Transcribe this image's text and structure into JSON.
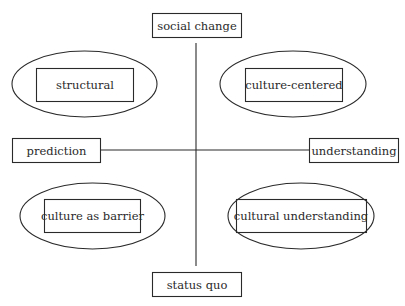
{
  "axes": {
    "vertical": {
      "top": "social change",
      "bottom": "status quo"
    },
    "horizontal": {
      "left": "prediction",
      "right": "understanding"
    }
  },
  "quadrants": {
    "top_left": "structural",
    "top_right": "culture-centered",
    "bottom_left": "culture as barrier",
    "bottom_right": "cultural understanding"
  },
  "colors": {
    "line": "#2a2a2a",
    "background": "#ffffff"
  }
}
